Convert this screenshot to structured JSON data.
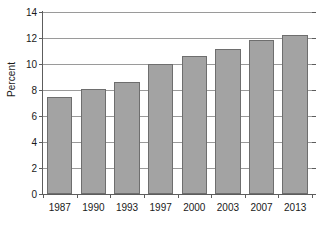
{
  "chart_data": {
    "type": "bar",
    "title": "",
    "subtitle": "",
    "xlabel": "",
    "ylabel": "Percent",
    "categories": [
      "1987",
      "1990",
      "1993",
      "1997",
      "2000",
      "2003",
      "2007",
      "2013"
    ],
    "values": [
      7.5,
      8.05,
      8.6,
      10.0,
      10.65,
      11.15,
      11.85,
      12.25
    ],
    "ylim": [
      0,
      14
    ],
    "ytick_values": [
      0,
      2,
      4,
      6,
      8,
      10,
      12,
      14
    ],
    "ytick_labels": [
      "0",
      "2",
      "4",
      "6",
      "8",
      "10",
      "12",
      "14"
    ],
    "grid": "horizontal",
    "legend": "none",
    "annotations": [],
    "colors": {
      "bar_fill": "#a3a3a3",
      "bar_edge": "#6e6e6e",
      "gridline": "#9a9a9a",
      "axis": "#5d5d5d",
      "text": "#1a1a1a",
      "background": "#ffffff"
    }
  }
}
